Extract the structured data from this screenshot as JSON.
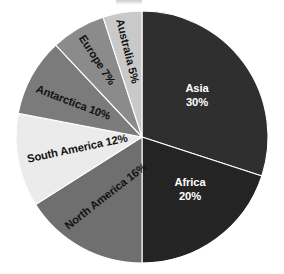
{
  "chart_data": {
    "type": "pie",
    "title": "",
    "xlabel": "",
    "ylabel": "",
    "legend_position": "none",
    "grid": false,
    "labels_inside_slices": true,
    "start_angle_deg": 0,
    "direction": "clockwise",
    "units": "percent",
    "total": 100,
    "categories": [
      "Asia",
      "Africa",
      "North America",
      "South America",
      "Antarctica",
      "Europe",
      "Australia"
    ],
    "values": [
      30,
      20,
      16,
      12,
      10,
      7,
      5
    ],
    "slices": [
      {
        "name": "Asia",
        "value": 30,
        "label": "Asia",
        "value_label": "30%",
        "color": "#2f2f2f",
        "text_color": "#ffffff",
        "label_style": "two-line-horizontal"
      },
      {
        "name": "Africa",
        "value": 20,
        "label": "Africa",
        "value_label": "20%",
        "color": "#242424",
        "text_color": "#ffffff",
        "label_style": "two-line-horizontal"
      },
      {
        "name": "North America",
        "value": 16,
        "label": "North America 16%",
        "value_label": "16%",
        "color": "#6f6f6f",
        "text_color": "#121212",
        "label_style": "rotated"
      },
      {
        "name": "South America",
        "value": 12,
        "label": "South America 12%",
        "value_label": "12%",
        "color": "#ebebeb",
        "text_color": "#121212",
        "label_style": "rotated"
      },
      {
        "name": "Antarctica",
        "value": 10,
        "label": "Antarctica 10%",
        "value_label": "10%",
        "color": "#7b7b7b",
        "text_color": "#121212",
        "label_style": "rotated"
      },
      {
        "name": "Europe",
        "value": 7,
        "label": "Europe 7%",
        "value_label": "7%",
        "color": "#8b8b8b",
        "text_color": "#121212",
        "label_style": "rotated"
      },
      {
        "name": "Australia",
        "value": 5,
        "label": "Australia 5%",
        "value_label": "5%",
        "color": "#c9c9c9",
        "text_color": "#121212",
        "label_style": "rotated"
      }
    ]
  },
  "labels": {
    "asia_name": "Asia",
    "asia_value": "30%",
    "africa_name": "Africa",
    "africa_value": "20%",
    "north_america": "North America 16%",
    "south_america": "South America 12%",
    "antarctica": "Antarctica 10%",
    "europe": "Europe 7%",
    "australia": "Australia 5%"
  },
  "colors": {
    "background": "#ffffff",
    "slice_border": "#ffffff",
    "asia": "#2f2f2f",
    "africa": "#242424",
    "north_america": "#6f6f6f",
    "south_america": "#ebebeb",
    "antarctica": "#7b7b7b",
    "europe": "#8b8b8b",
    "australia": "#c9c9c9"
  }
}
